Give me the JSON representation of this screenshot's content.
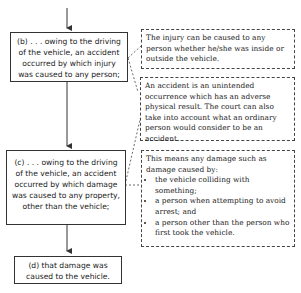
{
  "flow_steps": [
    {
      "id": "b",
      "text": "(b) . . . owing to the driving of the vehicle, an accident occurred by which injury was caused to any person;"
    },
    {
      "id": "c",
      "text": "(c) . . . owing to the driving of the vehicle, an accident occurred by which damage was caused to any property, other than the vehicle;"
    },
    {
      "id": "d",
      "text": "(d) that damage was caused to the vehicle."
    }
  ],
  "notes": {
    "injury": "The injury can be caused to any person whether he/she was inside or outside the vehicle.",
    "accident": "An accident is an unintended occurrence which has an adverse physical result. The court can also take into account what an ordinary person would consider to be an accident.",
    "damage": {
      "intro": "This means any damage such as damage caused by:",
      "bullets": [
        "the vehicle colliding with something;",
        "a person when attempting to avoid arrest; and",
        "a person other than the person who first took the vehicle."
      ]
    }
  }
}
